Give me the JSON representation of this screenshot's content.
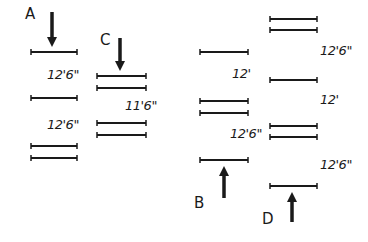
{
  "diagram": {
    "ink_color": "#1a1a1a",
    "background": "#ffffff",
    "configurations": [
      {
        "id": "A",
        "label": "A",
        "label_pos": [
          26,
          14
        ],
        "arrow": {
          "direction": "down",
          "x": 52,
          "y_start": 12,
          "y_end": 47
        },
        "x_range": [
          31,
          77
        ],
        "levels_y": [
          52,
          98,
          146,
          158
        ],
        "dimensions": [
          {
            "text": "12'6\"",
            "pos": [
              47,
              68
            ]
          },
          {
            "text": "12'6\"",
            "pos": [
              47,
              118
            ]
          }
        ]
      },
      {
        "id": "C",
        "label": "C",
        "label_pos": [
          101,
          34
        ],
        "arrow": {
          "direction": "down",
          "x": 120,
          "y_start": 38,
          "y_end": 71
        },
        "x_range": [
          97,
          146
        ],
        "levels_y": [
          76,
          88,
          123,
          135
        ],
        "dimensions": [
          {
            "text": "11'6\"",
            "pos": [
              126,
              99
            ]
          }
        ]
      },
      {
        "id": "B",
        "label": "B",
        "label_pos": [
          195,
          197
        ],
        "arrow": {
          "direction": "up",
          "x": 224,
          "y_start": 198,
          "y_end": 166
        },
        "x_range": [
          200,
          248
        ],
        "levels_y": [
          52,
          101,
          113,
          160
        ],
        "dimensions": [
          {
            "text": "12'",
            "pos": [
              232,
              68
            ]
          },
          {
            "text": "12'6\"",
            "pos": [
              230,
              128
            ]
          }
        ]
      },
      {
        "id": "D",
        "label": "D",
        "label_pos": [
          263,
          212
        ],
        "arrow": {
          "direction": "up",
          "x": 292,
          "y_start": 222,
          "y_end": 192
        },
        "x_range": [
          270,
          317
        ],
        "levels_y": [
          19,
          30,
          80,
          126,
          137,
          186
        ],
        "dimensions": [
          {
            "text": "12'6\"",
            "pos": [
              320,
              44
            ]
          },
          {
            "text": "12'",
            "pos": [
              320,
              93
            ]
          },
          {
            "text": "12'6\"",
            "pos": [
              320,
              158
            ]
          }
        ]
      }
    ]
  },
  "labels": {
    "A": "A",
    "B": "B",
    "C": "C",
    "D": "D",
    "A_dim_1": "12'6\"",
    "A_dim_2": "12'6\"",
    "C_dim_1": "11'6\"",
    "B_dim_1": "12'",
    "B_dim_2": "12'6\"",
    "D_dim_1": "12'6\"",
    "D_dim_2": "12'",
    "D_dim_3": "12'6\""
  }
}
